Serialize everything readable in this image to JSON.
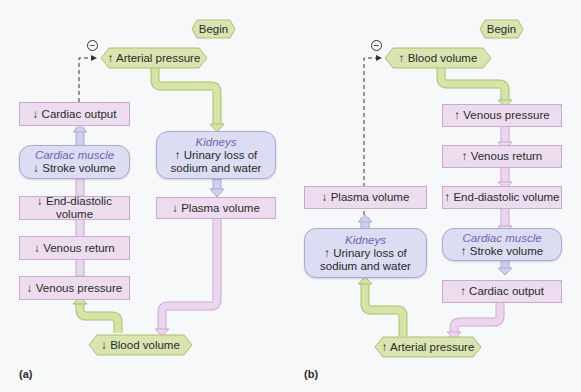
{
  "colors": {
    "background": "#f7f8f9",
    "step_box_fill": "#ecdcee",
    "step_box_border": "#c9a9cf",
    "organ_box_fill": "#dcdcf2",
    "organ_box_border": "#a9a9d3",
    "organ_title": "#6d64b8",
    "hex_fill": "#d9e4b0",
    "hex_border": "#a9bf74",
    "green_arrow": "#cfe0a0",
    "pink_arrow": "#e6cde9",
    "lavender_arrow": "#cfd0ee"
  },
  "panel_a": {
    "label": "(a)",
    "begin": "Begin",
    "feedback_sign": "−",
    "start_node": "↑ Arterial pressure",
    "end_node": "↓ Blood volume",
    "left_chain": [
      "↓ Cardiac output",
      {
        "organ": "Cardiac muscle",
        "text": "↓ Stroke volume"
      },
      "↓ End-diastolic volume",
      "↓ Venous return",
      "↓ Venous pressure"
    ],
    "right_chain": [
      {
        "organ": "Kidneys",
        "text_line1": "↑ Urinary loss of",
        "text_line2": "sodium and water"
      },
      "↓ Plasma volume"
    ]
  },
  "panel_b": {
    "label": "(b)",
    "begin": "Begin",
    "feedback_sign": "−",
    "start_node": "↑ Blood volume",
    "end_node": "↑ Arterial pressure",
    "right_chain": [
      "↑ Venous pressure",
      "↑ Venous return",
      "↑ End-diastolic volume",
      {
        "organ": "Cardiac muscle",
        "text": "↑ Stroke volume"
      },
      "↑ Cardiac output"
    ],
    "left_chain": [
      "↓ Plasma volume",
      {
        "organ": "Kidneys",
        "text_line1": "↑ Urinary loss of",
        "text_line2": "sodium and water"
      }
    ]
  }
}
